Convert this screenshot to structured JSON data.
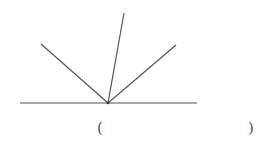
{
  "diagram": {
    "baseline": {
      "x1": 20,
      "y1": 103,
      "x2": 197,
      "y2": 103
    },
    "vertex": {
      "x": 108,
      "y": 103
    },
    "rays": [
      {
        "name": "left",
        "x": 41,
        "y": 44
      },
      {
        "name": "top",
        "x": 124,
        "y": 13
      },
      {
        "name": "right",
        "x": 176,
        "y": 45
      }
    ],
    "stroke_color": "#555555"
  },
  "answer": {
    "open_paren": "(",
    "close_paren": ")"
  }
}
